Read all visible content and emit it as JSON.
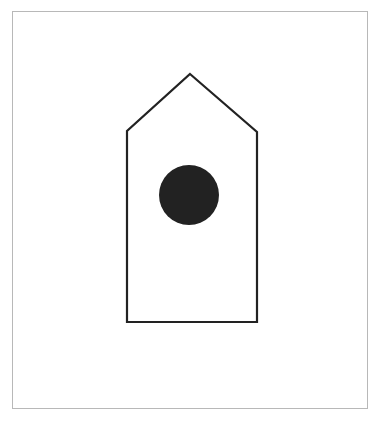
{
  "figure": {
    "frame": {
      "x": 12,
      "y": 11,
      "width": 356,
      "height": 398,
      "stroke": "#b8b8b8"
    },
    "house": {
      "points": [
        [
          190,
          74
        ],
        [
          257,
          132
        ],
        [
          257,
          322
        ],
        [
          127,
          322
        ],
        [
          127,
          131
        ]
      ],
      "stroke": "#222222",
      "stroke_width": 2.2,
      "fill": "#ffffff"
    },
    "hole": {
      "cx": 189,
      "cy": 195,
      "r": 30,
      "fill": "#222222"
    }
  }
}
